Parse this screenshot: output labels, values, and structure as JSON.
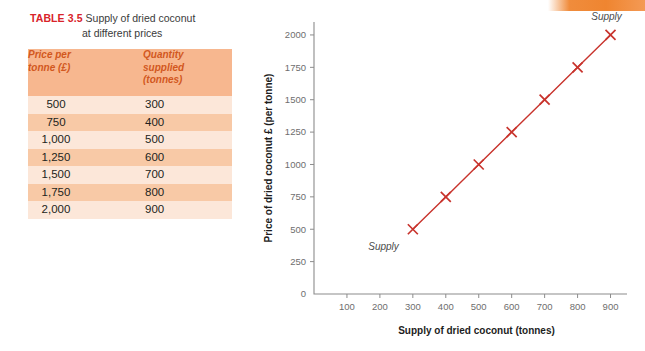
{
  "page": {
    "background_color": "#ffffff",
    "edge_bar_color": "#f08c3c"
  },
  "table_block": {
    "caption_number": "TABLE 3.5",
    "caption_line1": "Supply of dried coconut",
    "caption_line2": "at different prices",
    "caption_number_color": "#d8232a",
    "header_bg_color": "#f7b78f",
    "header_text_color": "#d2581e",
    "row_light_color": "#fce7d9",
    "row_dark_color": "#f8c9a6",
    "columns": [
      {
        "line1": "Price per",
        "line2": "tonne (£)",
        "line3": ""
      },
      {
        "line1": "Quantity",
        "line2": "supplied",
        "line3": "(tonnes)"
      }
    ],
    "rows": [
      {
        "price": "500",
        "quantity": "300"
      },
      {
        "price": "750",
        "quantity": "400"
      },
      {
        "price": "1,000",
        "quantity": "500"
      },
      {
        "price": "1,250",
        "quantity": "600"
      },
      {
        "price": "1,500",
        "quantity": "700"
      },
      {
        "price": "1,750",
        "quantity": "800"
      },
      {
        "price": "2,000",
        "quantity": "900"
      }
    ]
  },
  "chart_data": {
    "type": "line",
    "title": "",
    "xlabel": "Supply of dried coconut (tonnes)",
    "ylabel": "Price of dried coconut £ (per tonne)",
    "xlim": [
      0,
      950
    ],
    "ylim": [
      0,
      2100
    ],
    "xticks": [
      100,
      200,
      300,
      400,
      500,
      600,
      700,
      800,
      900
    ],
    "xtick_labels": [
      "100",
      "200",
      "300",
      "400",
      "500",
      "600",
      "700",
      "800",
      "900"
    ],
    "yticks": [
      0,
      250,
      500,
      750,
      1000,
      1250,
      1500,
      1750,
      2000
    ],
    "ytick_labels": [
      "0",
      "250",
      "500",
      "750",
      "1000",
      "1250",
      "1500",
      "1750",
      "2000"
    ],
    "grid": false,
    "legend_position": "none",
    "series": [
      {
        "name": "Supply",
        "color": "#c8332c",
        "marker": "x",
        "x": [
          300,
          400,
          500,
          600,
          700,
          800,
          900
        ],
        "y": [
          500,
          750,
          1000,
          1250,
          1500,
          1750,
          2000
        ]
      }
    ],
    "annotations": [
      {
        "text": "Supply",
        "x": 300,
        "y": 500,
        "position": "below-left"
      },
      {
        "text": "Supply",
        "x": 900,
        "y": 2000,
        "position": "above-right"
      }
    ]
  }
}
